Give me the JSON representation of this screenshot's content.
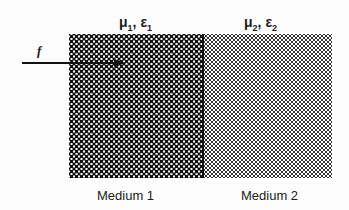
{
  "media": [
    {
      "name": "Medium 1",
      "mu": "μ",
      "mu_sub": "1",
      "eps": "ε",
      "eps_sub": "1",
      "sep": ", "
    },
    {
      "name": "Medium 2",
      "mu": "μ",
      "mu_sub": "2",
      "eps": "ε",
      "eps_sub": "2",
      "sep": ", "
    }
  ],
  "incident": {
    "label": "f"
  }
}
